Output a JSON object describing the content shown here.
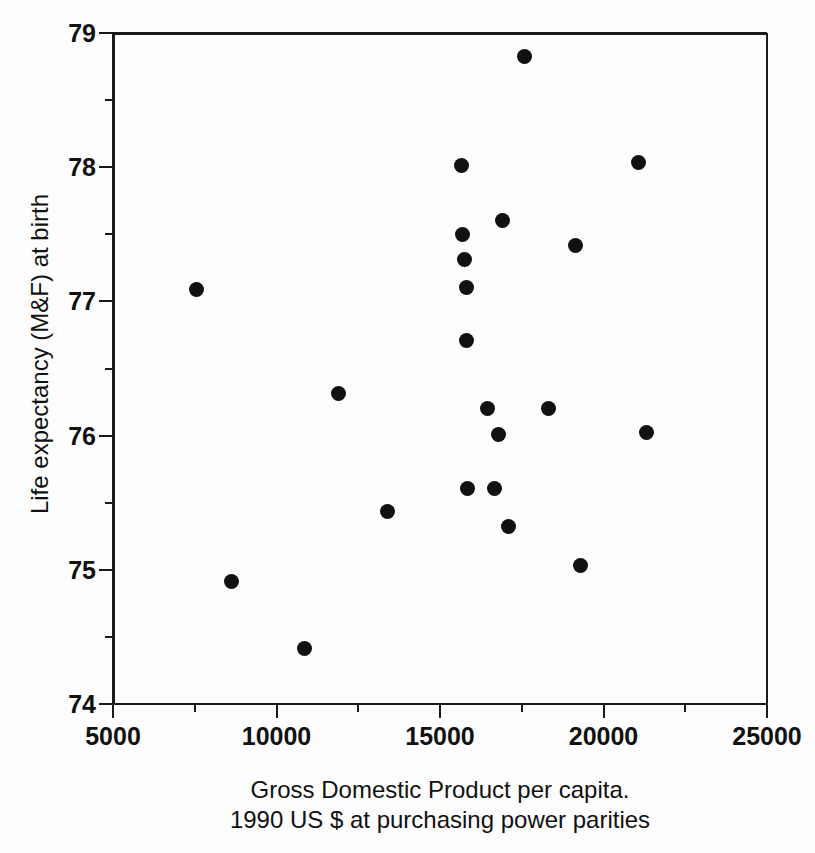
{
  "chart_data": {
    "type": "scatter",
    "title": "",
    "xlabel": "Gross Domestic Product per capita.",
    "xlabel_line2": "1990 US $ at purchasing power parities",
    "ylabel": "Life expectancy (M&F) at birth",
    "xlim": [
      5000,
      25000
    ],
    "ylim": [
      74,
      79
    ],
    "xticks": [
      5000,
      10000,
      15000,
      20000,
      25000
    ],
    "xtick_labels": [
      "5000",
      "10000",
      "15000",
      "20000",
      "25000"
    ],
    "xminor_ticks": [
      7500,
      12500,
      17500,
      22500
    ],
    "yticks": [
      74,
      75,
      76,
      77,
      78,
      79
    ],
    "ytick_labels": [
      "74",
      "75",
      "76",
      "77",
      "78",
      "79"
    ],
    "yminor_ticks": [
      74.5,
      75.5,
      76.5,
      77.5,
      78.5
    ],
    "grid": false,
    "legend": null,
    "marker": "filled-circle",
    "marker_color": "#111111",
    "marker_size_px": 15,
    "n_points": 22,
    "x": [
      7500,
      8560,
      10800,
      11820,
      13320,
      15600,
      15640,
      15700,
      15740,
      15760,
      15780,
      16400,
      16600,
      16720,
      16850,
      17020,
      17530,
      18260,
      19090,
      19230,
      21000,
      21250
    ],
    "y": [
      77.1,
      74.93,
      74.43,
      76.33,
      75.45,
      78.03,
      77.51,
      77.33,
      77.12,
      76.72,
      75.62,
      76.22,
      75.62,
      76.02,
      77.62,
      75.34,
      78.84,
      76.22,
      77.43,
      75.05,
      78.05,
      76.04
    ],
    "points": [
      {
        "x": 7500,
        "y": 77.1
      },
      {
        "x": 8560,
        "y": 74.93
      },
      {
        "x": 10800,
        "y": 74.43
      },
      {
        "x": 11820,
        "y": 76.33
      },
      {
        "x": 13320,
        "y": 75.45
      },
      {
        "x": 15600,
        "y": 78.03
      },
      {
        "x": 15640,
        "y": 77.51
      },
      {
        "x": 15700,
        "y": 77.33
      },
      {
        "x": 15740,
        "y": 77.12
      },
      {
        "x": 15760,
        "y": 76.72
      },
      {
        "x": 15780,
        "y": 75.62
      },
      {
        "x": 16400,
        "y": 76.22
      },
      {
        "x": 16600,
        "y": 75.62
      },
      {
        "x": 16720,
        "y": 76.02
      },
      {
        "x": 16850,
        "y": 77.62
      },
      {
        "x": 17020,
        "y": 75.34
      },
      {
        "x": 17530,
        "y": 78.84
      },
      {
        "x": 18260,
        "y": 76.22
      },
      {
        "x": 19090,
        "y": 77.43
      },
      {
        "x": 19230,
        "y": 75.05
      },
      {
        "x": 21000,
        "y": 78.05
      },
      {
        "x": 21250,
        "y": 76.04
      }
    ]
  },
  "axis_color": "#1a1a1a",
  "background_color": "#fdfdfd"
}
